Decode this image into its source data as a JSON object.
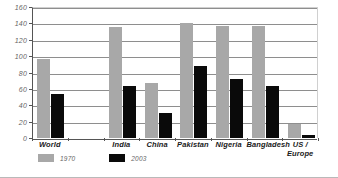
{
  "chart_data": {
    "type": "bar",
    "title": "",
    "xlabel": "",
    "ylabel": "",
    "ylim": [
      0,
      160
    ],
    "ytick_step": 20,
    "yticks": [
      0,
      20,
      40,
      60,
      80,
      100,
      120,
      140,
      160
    ],
    "grid": true,
    "legend_position": "below-left",
    "categories": [
      "World",
      "",
      "India",
      "China",
      "Pakistan",
      "Nigeria",
      "Bangladesh",
      "US / Europe"
    ],
    "series": [
      {
        "name": "1970",
        "color": "#a8a8a8",
        "values": [
          97,
          null,
          135,
          67,
          140,
          137,
          137,
          17
        ]
      },
      {
        "name": "2003",
        "color": "#0a0a0a",
        "values": [
          54,
          null,
          64,
          30,
          88,
          72,
          63,
          4
        ]
      }
    ]
  },
  "legend": {
    "items": [
      {
        "label": "1970",
        "color": "#a8a8a8"
      },
      {
        "label": "2003",
        "color": "#0a0a0a"
      }
    ]
  },
  "axis": {
    "y_tick_labels": [
      "160",
      "140",
      "120",
      "100",
      "80",
      "60",
      "40",
      "20",
      "0"
    ]
  },
  "category_labels": {
    "world": "World",
    "india": "India",
    "china": "China",
    "pakistan": "Pakistan",
    "nigeria": "Nigeria",
    "bangladesh": "Bangladesh",
    "us_europe_line1": "US /",
    "us_europe_line2": "Europe"
  }
}
